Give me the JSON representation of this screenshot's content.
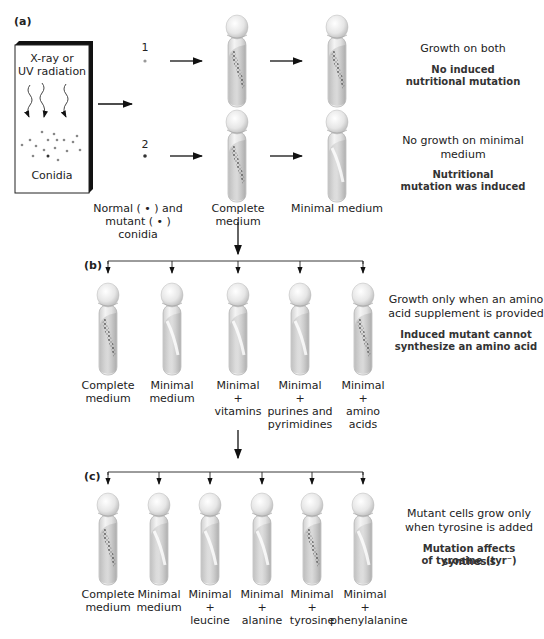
{
  "panel_a": {
    "label": "(a)",
    "box": {
      "title_line1": "X-ray or",
      "title_line2": "UV radiation",
      "caption": "Conidia"
    },
    "row1_number": "1",
    "row2_number": "2",
    "conidia_label_line1": "Normal ( • ) and",
    "conidia_label_line2": "mutant ( • ) conidia",
    "tube_labels": [
      "Complete medium",
      "Minimal medium"
    ],
    "row1_note": {
      "text": "Growth on both",
      "bold_line1": "No induced",
      "bold_line2": "nutritional mutation"
    },
    "row2_note": {
      "text_line1": "No growth on minimal",
      "text_line2": "medium",
      "bold_line1": "Nutritional",
      "bold_line2": "mutation was induced"
    }
  },
  "panel_b": {
    "label": "(b)",
    "tubes": [
      {
        "line1": "Complete",
        "line2": "medium",
        "line3": "",
        "line4": "",
        "growth": true
      },
      {
        "line1": "Minimal",
        "line2": "medium",
        "line3": "",
        "line4": "",
        "growth": false
      },
      {
        "line1": "Minimal",
        "line2": "+",
        "line3": "vitamins",
        "line4": "",
        "growth": false
      },
      {
        "line1": "Minimal",
        "line2": "+",
        "line3": "purines and",
        "line4": "pyrimidines",
        "growth": false
      },
      {
        "line1": "Minimal",
        "line2": "+",
        "line3": "amino",
        "line4": "acids",
        "growth": true
      }
    ],
    "note": {
      "text_line1": "Growth only when an amino",
      "text_line2": "acid supplement is provided",
      "bold_line1": "Induced mutant cannot",
      "bold_line2": "synthesize an amino acid"
    }
  },
  "panel_c": {
    "label": "(c)",
    "tubes": [
      {
        "line1": "Complete",
        "line2": "medium",
        "line3": "",
        "growth": true
      },
      {
        "line1": "Minimal",
        "line2": "medium",
        "line3": "",
        "growth": false
      },
      {
        "line1": "Minimal",
        "line2": "+",
        "line3": "leucine",
        "growth": false
      },
      {
        "line1": "Minimal",
        "line2": "+",
        "line3": "alanine",
        "growth": false
      },
      {
        "line1": "Minimal",
        "line2": "+",
        "line3": "tyrosine",
        "growth": true
      },
      {
        "line1": "Minimal",
        "line2": "+",
        "line3": "phenylalanine",
        "growth": false
      }
    ],
    "note": {
      "text_line1": "Mutant cells grow only",
      "text_line2": "when tyrosine is added",
      "bold_line1": "Mutation affects synthesis",
      "bold_line2": "of tyrosine (tyr⁻)"
    }
  }
}
